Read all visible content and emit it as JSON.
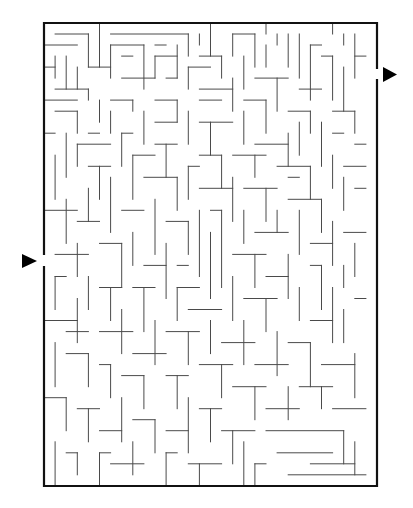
{
  "puzzle": {
    "type": "maze",
    "grid": {
      "cols": 30,
      "rows": 42,
      "origin_x": 44,
      "origin_y": 23,
      "cell_w": 11.1,
      "cell_h": 11.02
    },
    "colors": {
      "border": "#111111",
      "wall": "#4a4a4a",
      "arrow": "#000000",
      "background": "#ffffff"
    },
    "entrance": {
      "side": "left",
      "row": 21,
      "arrow_icon": "arrow-right-icon",
      "arrow": {
        "x": 22,
        "y": 254,
        "w": 15,
        "h": 14
      }
    },
    "exit": {
      "side": "right",
      "row": 4,
      "arrow_icon": "arrow-right-icon",
      "arrow": {
        "x": 383,
        "y": 67,
        "w": 14,
        "h": 15
      }
    },
    "walls": [
      [
        1,
        1,
        4,
        1
      ],
      [
        4,
        1,
        4,
        4
      ],
      [
        3,
        2,
        0,
        2
      ],
      [
        5,
        0,
        5,
        4
      ],
      [
        6,
        1,
        13,
        1
      ],
      [
        13,
        1,
        13,
        3
      ],
      [
        14,
        2,
        14,
        1
      ],
      [
        15,
        0,
        15,
        3
      ],
      [
        17,
        1,
        19,
        1
      ],
      [
        17,
        1,
        17,
        3
      ],
      [
        19,
        1,
        19,
        4
      ],
      [
        20,
        0,
        20,
        1
      ],
      [
        21,
        1,
        21,
        2
      ],
      [
        22,
        1,
        22,
        4
      ],
      [
        23,
        1,
        23,
        5
      ],
      [
        26,
        0,
        26,
        1
      ],
      [
        27,
        1,
        27,
        2
      ],
      [
        28,
        1,
        28,
        5
      ],
      [
        29,
        3,
        28,
        3
      ],
      [
        6,
        2,
        6,
        5
      ],
      [
        6,
        2,
        9,
        2
      ],
      [
        9,
        2,
        9,
        6
      ],
      [
        10,
        2,
        11,
        2
      ],
      [
        12,
        2,
        12,
        5
      ],
      [
        8,
        3,
        7,
        3
      ],
      [
        10,
        3,
        10,
        5
      ],
      [
        10,
        3,
        12,
        3
      ],
      [
        2,
        3,
        2,
        6
      ],
      [
        1,
        3,
        1,
        5
      ],
      [
        0,
        4,
        1,
        4
      ],
      [
        3,
        4,
        3,
        6
      ],
      [
        4,
        4,
        6,
        4
      ],
      [
        14,
        3,
        16,
        3
      ],
      [
        16,
        3,
        16,
        5
      ],
      [
        18,
        3,
        18,
        6
      ],
      [
        20,
        2,
        20,
        4
      ],
      [
        24,
        2,
        24,
        7
      ],
      [
        25,
        2,
        24,
        2
      ],
      [
        26,
        3,
        26,
        7
      ],
      [
        25,
        3,
        26,
        3
      ],
      [
        27,
        4,
        27,
        8
      ],
      [
        1,
        6,
        4,
        6
      ],
      [
        4,
        6,
        4,
        7
      ],
      [
        7,
        5,
        10,
        5
      ],
      [
        11,
        5,
        12,
        5
      ],
      [
        13,
        4,
        15,
        4
      ],
      [
        13,
        4,
        13,
        6
      ],
      [
        14,
        6,
        17,
        6
      ],
      [
        17,
        5,
        17,
        8
      ],
      [
        19,
        5,
        22,
        5
      ],
      [
        21,
        5,
        21,
        8
      ],
      [
        23,
        6,
        25,
        6
      ],
      [
        0,
        7,
        3,
        7
      ],
      [
        5,
        7,
        5,
        9
      ],
      [
        6,
        7,
        8,
        7
      ],
      [
        8,
        7,
        8,
        8
      ],
      [
        10,
        7,
        12,
        7
      ],
      [
        12,
        7,
        12,
        9
      ],
      [
        14,
        7,
        16,
        7
      ],
      [
        18,
        7,
        20,
        7
      ],
      [
        20,
        7,
        20,
        10
      ],
      [
        22,
        8,
        24,
        8
      ],
      [
        24,
        8,
        24,
        10
      ],
      [
        26,
        8,
        28,
        8
      ],
      [
        28,
        8,
        28,
        10
      ],
      [
        1,
        8,
        3,
        8
      ],
      [
        3,
        8,
        3,
        10
      ],
      [
        6,
        8,
        6,
        10
      ],
      [
        9,
        8,
        9,
        11
      ],
      [
        10,
        9,
        12,
        9
      ],
      [
        13,
        8,
        13,
        11
      ],
      [
        14,
        9,
        17,
        9
      ],
      [
        15,
        9,
        15,
        12
      ],
      [
        18,
        8,
        18,
        11
      ],
      [
        19,
        11,
        22,
        11
      ],
      [
        22,
        10,
        22,
        13
      ],
      [
        23,
        9,
        23,
        12
      ],
      [
        25,
        9,
        25,
        13
      ],
      [
        26,
        10,
        27,
        10
      ],
      [
        29,
        11,
        28,
        11
      ],
      [
        0,
        10,
        1,
        10
      ],
      [
        2,
        10,
        2,
        14
      ],
      [
        4,
        10,
        5,
        10
      ],
      [
        7,
        10,
        8,
        10
      ],
      [
        7,
        10,
        7,
        13
      ],
      [
        10,
        11,
        12,
        11
      ],
      [
        11,
        11,
        11,
        14
      ],
      [
        14,
        12,
        16,
        12
      ],
      [
        16,
        12,
        16,
        15
      ],
      [
        17,
        12,
        20,
        12
      ],
      [
        19,
        12,
        19,
        14
      ],
      [
        21,
        13,
        24,
        13
      ],
      [
        24,
        13,
        24,
        16
      ],
      [
        26,
        12,
        26,
        15
      ],
      [
        27,
        13,
        29,
        13
      ],
      [
        1,
        12,
        1,
        16
      ],
      [
        3,
        11,
        6,
        11
      ],
      [
        3,
        11,
        3,
        13
      ],
      [
        4,
        13,
        6,
        13
      ],
      [
        5,
        13,
        5,
        16
      ],
      [
        8,
        12,
        10,
        12
      ],
      [
        8,
        12,
        8,
        16
      ],
      [
        9,
        14,
        12,
        14
      ],
      [
        12,
        14,
        12,
        17
      ],
      [
        13,
        13,
        14,
        13
      ],
      [
        13,
        13,
        13,
        16
      ],
      [
        14,
        15,
        17,
        15
      ],
      [
        17,
        14,
        17,
        18
      ],
      [
        18,
        15,
        21,
        15
      ],
      [
        20,
        15,
        20,
        18
      ],
      [
        22,
        14,
        23,
        14
      ],
      [
        22,
        16,
        25,
        16
      ],
      [
        25,
        16,
        25,
        19
      ],
      [
        27,
        14,
        27,
        17
      ],
      [
        28,
        15,
        29,
        15
      ],
      [
        0,
        17,
        3,
        17
      ],
      [
        2,
        16,
        2,
        20
      ],
      [
        3,
        18,
        5,
        18
      ],
      [
        4,
        15,
        4,
        18
      ],
      [
        6,
        14,
        6,
        19
      ],
      [
        7,
        17,
        9,
        17
      ],
      [
        10,
        16,
        10,
        21
      ],
      [
        11,
        18,
        13,
        18
      ],
      [
        13,
        18,
        13,
        21
      ],
      [
        14,
        17,
        14,
        23
      ],
      [
        15,
        17,
        16,
        17
      ],
      [
        16,
        17,
        16,
        24
      ],
      [
        18,
        17,
        18,
        20
      ],
      [
        19,
        19,
        22,
        19
      ],
      [
        21,
        17,
        21,
        19
      ],
      [
        23,
        17,
        23,
        21
      ],
      [
        24,
        20,
        26,
        20
      ],
      [
        26,
        18,
        26,
        22
      ],
      [
        27,
        19,
        29,
        19
      ],
      [
        28,
        20,
        28,
        23
      ],
      [
        1,
        21,
        4,
        21
      ],
      [
        3,
        20,
        3,
        23
      ],
      [
        5,
        20,
        7,
        20
      ],
      [
        7,
        20,
        7,
        24
      ],
      [
        8,
        19,
        8,
        22
      ],
      [
        9,
        22,
        11,
        22
      ],
      [
        11,
        20,
        11,
        25
      ],
      [
        12,
        22,
        13,
        22
      ],
      [
        15,
        19,
        15,
        25
      ],
      [
        17,
        21,
        20,
        21
      ],
      [
        19,
        21,
        19,
        24
      ],
      [
        20,
        23,
        22,
        23
      ],
      [
        22,
        21,
        22,
        25
      ],
      [
        24,
        22,
        25,
        22
      ],
      [
        25,
        22,
        25,
        26
      ],
      [
        27,
        22,
        27,
        24
      ],
      [
        1,
        23,
        2,
        23
      ],
      [
        1,
        23,
        1,
        26
      ],
      [
        4,
        23,
        4,
        26
      ],
      [
        5,
        24,
        7,
        24
      ],
      [
        6,
        24,
        6,
        27
      ],
      [
        8,
        24,
        10,
        24
      ],
      [
        9,
        24,
        9,
        28
      ],
      [
        12,
        24,
        14,
        24
      ],
      [
        12,
        24,
        12,
        27
      ],
      [
        13,
        26,
        16,
        26
      ],
      [
        17,
        23,
        17,
        27
      ],
      [
        18,
        25,
        21,
        25
      ],
      [
        20,
        25,
        20,
        28
      ],
      [
        23,
        24,
        23,
        27
      ],
      [
        24,
        27,
        26,
        27
      ],
      [
        26,
        24,
        26,
        29
      ],
      [
        28,
        25,
        29,
        25
      ],
      [
        27,
        26,
        27,
        29
      ],
      [
        0,
        27,
        3,
        27
      ],
      [
        2,
        28,
        4,
        28
      ],
      [
        3,
        25,
        3,
        29
      ],
      [
        5,
        28,
        8,
        28
      ],
      [
        7,
        26,
        7,
        30
      ],
      [
        8,
        30,
        11,
        30
      ],
      [
        10,
        27,
        10,
        31
      ],
      [
        11,
        28,
        14,
        28
      ],
      [
        13,
        28,
        13,
        31
      ],
      [
        15,
        27,
        15,
        30
      ],
      [
        16,
        29,
        19,
        29
      ],
      [
        18,
        27,
        18,
        31
      ],
      [
        19,
        31,
        22,
        31
      ],
      [
        21,
        28,
        21,
        32
      ],
      [
        22,
        29,
        24,
        29
      ],
      [
        24,
        29,
        24,
        33
      ],
      [
        25,
        31,
        28,
        31
      ],
      [
        28,
        30,
        28,
        34
      ],
      [
        1,
        29,
        1,
        33
      ],
      [
        2,
        30,
        4,
        30
      ],
      [
        4,
        30,
        4,
        33
      ],
      [
        5,
        31,
        6,
        31
      ],
      [
        6,
        31,
        6,
        34
      ],
      [
        7,
        32,
        9,
        32
      ],
      [
        9,
        32,
        9,
        35
      ],
      [
        11,
        32,
        13,
        32
      ],
      [
        12,
        32,
        12,
        35
      ],
      [
        14,
        31,
        17,
        31
      ],
      [
        16,
        31,
        16,
        34
      ],
      [
        17,
        33,
        20,
        33
      ],
      [
        19,
        33,
        19,
        36
      ],
      [
        20,
        35,
        23,
        35
      ],
      [
        22,
        33,
        22,
        36
      ],
      [
        23,
        33,
        26,
        33
      ],
      [
        25,
        33,
        25,
        35
      ],
      [
        26,
        35,
        29,
        35
      ],
      [
        0,
        34,
        2,
        34
      ],
      [
        2,
        34,
        2,
        37
      ],
      [
        3,
        35,
        5,
        35
      ],
      [
        4,
        35,
        4,
        38
      ],
      [
        5,
        37,
        7,
        37
      ],
      [
        7,
        34,
        7,
        38
      ],
      [
        8,
        36,
        10,
        36
      ],
      [
        10,
        36,
        10,
        39
      ],
      [
        11,
        37,
        13,
        37
      ],
      [
        13,
        34,
        13,
        39
      ],
      [
        14,
        35,
        16,
        35
      ],
      [
        15,
        35,
        15,
        38
      ],
      [
        16,
        37,
        19,
        37
      ],
      [
        17,
        37,
        17,
        40
      ],
      [
        20,
        37,
        27,
        37
      ],
      [
        27,
        37,
        27,
        40
      ],
      [
        21,
        39,
        26,
        39
      ],
      [
        18,
        38,
        18,
        42
      ],
      [
        1,
        38,
        1,
        42
      ],
      [
        2,
        39,
        3,
        39
      ],
      [
        3,
        39,
        3,
        41
      ],
      [
        5,
        39,
        6,
        39
      ],
      [
        5,
        39,
        5,
        42
      ],
      [
        6,
        40,
        9,
        40
      ],
      [
        8,
        38,
        8,
        41
      ],
      [
        11,
        39,
        12,
        39
      ],
      [
        11,
        39,
        11,
        42
      ],
      [
        13,
        40,
        16,
        40
      ],
      [
        14,
        40,
        14,
        42
      ],
      [
        19,
        40,
        20,
        40
      ],
      [
        19,
        40,
        19,
        42
      ],
      [
        22,
        41,
        29,
        41
      ],
      [
        24,
        40,
        28,
        40
      ],
      [
        28,
        38,
        28,
        41
      ]
    ]
  }
}
